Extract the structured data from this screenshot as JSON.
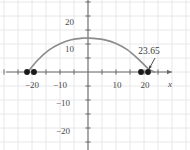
{
  "figure": {
    "width": 190,
    "height": 150,
    "background": "#ffffff"
  },
  "colors": {
    "grid": "#e2e2e6",
    "axis": "#6b6b6b",
    "curve": "#8c8c8c",
    "point": "#1a1a1a",
    "text": "#4a4a4a",
    "annotation": "#3a3a3a"
  },
  "axes": {
    "x_axis_name": "x",
    "y_axis_name": "",
    "x_ticks": [
      {
        "value": -20,
        "label": "−20",
        "px": 32,
        "py": 81
      },
      {
        "value": -10,
        "label": "−10",
        "px": 60,
        "py": 81
      },
      {
        "value": 10,
        "label": "10",
        "px": 117,
        "py": 81
      },
      {
        "value": 20,
        "label": "20",
        "px": 145,
        "py": 81
      }
    ],
    "y_ticks": [
      {
        "value": 20,
        "label": "20",
        "px": 74,
        "py": 18
      },
      {
        "value": 10,
        "label": "10",
        "px": 74,
        "py": 45
      },
      {
        "value": -10,
        "label": "−10",
        "px": 70,
        "py": 99
      },
      {
        "value": -20,
        "label": "−20",
        "px": 70,
        "py": 127
      }
    ],
    "origin": {
      "px": 88,
      "py": 72
    },
    "unit_px": 2.8,
    "xlim": [
      -31,
      36
    ],
    "ylim": [
      -26,
      28
    ],
    "grid": true,
    "grid_step": 5
  },
  "annotation": {
    "label": "23.65",
    "label_px": 149,
    "label_py": 47,
    "arrow_from": {
      "px": 155,
      "py": 58
    },
    "arrow_to": {
      "px": 149,
      "py": 69
    }
  },
  "chart_data": {
    "type": "line",
    "title": "",
    "xlabel": "x",
    "ylabel": "",
    "xlim": [
      -31,
      36
    ],
    "ylim": [
      -26,
      28
    ],
    "grid": true,
    "legend": "none",
    "series": [
      {
        "name": "trajectory",
        "color": "#8c8c8c",
        "x": [
          -21.5,
          -18,
          -14,
          -10,
          -6,
          -2,
          0,
          2,
          6,
          10,
          14,
          18,
          21.5,
          23.65
        ],
        "y": [
          0,
          4.2,
          7.8,
          10.1,
          11.5,
          12.1,
          12.1,
          12.0,
          11.5,
          10.2,
          8.0,
          4.6,
          1.2,
          0
        ]
      }
    ],
    "points": [
      {
        "name": "left-outer-point",
        "x": -21.7,
        "y": 0,
        "px": 27,
        "py": 72
      },
      {
        "name": "left-inner-point",
        "x": -19.4,
        "y": 0,
        "px": 34,
        "py": 72
      },
      {
        "name": "right-inner-point",
        "x": 19.0,
        "y": 0,
        "px": 141,
        "py": 72
      },
      {
        "name": "right-outer-point",
        "x": 23.65,
        "y": 0,
        "px": 148,
        "py": 72
      }
    ],
    "annotations": [
      {
        "text": "23.65",
        "target_x": 23.65,
        "target_y": 0
      }
    ]
  }
}
